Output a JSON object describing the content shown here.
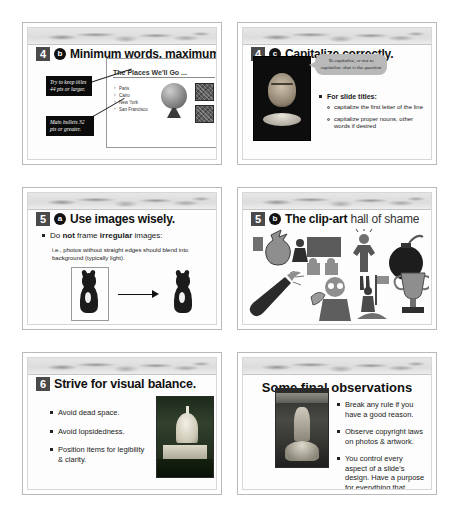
{
  "document": {
    "title": "Presentation design tips handout",
    "layout": "3 rows x 2 columns of slide thumbnails"
  },
  "slides": [
    {
      "id": "slide-4b",
      "number": "4",
      "letter": "b",
      "title": "Minimum words, maximum size",
      "callouts": [
        "Try to keep titles 44 pts or larger.",
        "Main bullets 32 pts or greater."
      ],
      "mini_slide": {
        "title": "The Places We'll Go ...",
        "bullets": [
          "Paris",
          "Cairo",
          "New York",
          "San Francisco"
        ],
        "images": [
          "globe-image",
          "photo-thumbnail-1",
          "photo-thumbnail-2"
        ]
      }
    },
    {
      "id": "slide-4c",
      "number": "4",
      "letter": "c",
      "title": "Capitalize correctly.",
      "image": "shakespeare-portrait",
      "bubble": "To capitalize, or not to capitalize: that is the question",
      "bullets": [
        {
          "text": "For slide titles:",
          "sub": [
            "capitalize the first letter of the line",
            "capitalize proper nouns, other words if desired"
          ]
        }
      ]
    },
    {
      "id": "slide-5a",
      "number": "5",
      "letter": "a",
      "title": "Use images wisely.",
      "bullet_rich": {
        "pre": "Do ",
        "bold1": "not",
        "mid": " frame ",
        "bold2": "irregular",
        "post": " images:"
      },
      "note": "i.e., photos without straight edges should blend into background (typically light).",
      "figure": "framed-dog-to-unframed-dog-arrow"
    },
    {
      "id": "slide-5b",
      "number": "5",
      "letter": "b",
      "title_bold": "The clip-art",
      "title_rest": " hall of shame",
      "clipart": [
        "money-bag-icon",
        "presenter-chart-icon",
        "frustrated-man-icon",
        "bomb-icon",
        "champagne-bottle-icon",
        "man-with-money-icon",
        "flag-climber-icon",
        "trophy-icon"
      ]
    },
    {
      "id": "slide-6",
      "number": "6",
      "letter": "",
      "title": "Strive for visual balance.",
      "bullets": [
        "Avoid dead space.",
        "Avoid lopsidedness.",
        "Position items for legibility & clarity."
      ],
      "image": "us-capitol-photo"
    },
    {
      "id": "slide-final",
      "number": "",
      "letter": "",
      "title": "Some final observations",
      "image": "fountain-statue-photo",
      "bullets": [
        "Break any rule if you have a good reason.",
        "Observe copyright laws on photos & artwork.",
        "You control every aspect of a slide's design.  Have a purpose for everything that happens."
      ]
    }
  ],
  "colors": {
    "page_background": "#ffffff",
    "slide_border": "#b9b9b9",
    "number_badge": "#4a4a4a",
    "letter_badge": "#111111",
    "callout_background": "#0b0b0b",
    "bubble_background": "#b9b9b9",
    "text": "#1a1a1a"
  }
}
